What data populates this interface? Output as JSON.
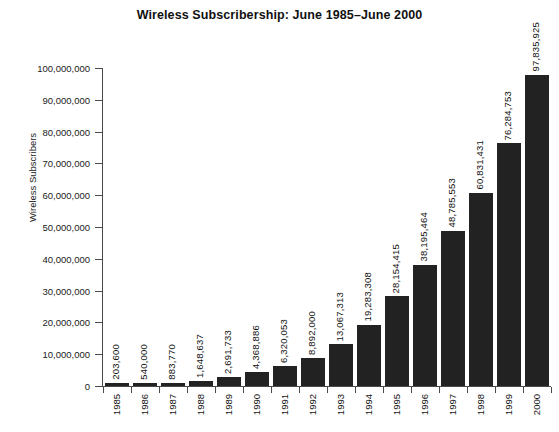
{
  "chart_data": {
    "type": "bar",
    "title": "Wireless Subscribership: June 1985–June 2000",
    "xlabel": "",
    "ylabel": "Wireless Subscribers",
    "ylim": [
      0,
      100000000
    ],
    "grid": false,
    "legend": null,
    "categories": [
      "1985",
      "1986",
      "1987",
      "1988",
      "1989",
      "1990",
      "1991",
      "1992",
      "1993",
      "1994",
      "1995",
      "1996",
      "1997",
      "1998",
      "1999",
      "2000"
    ],
    "values": [
      203600,
      540000,
      883770,
      1648637,
      2691733,
      4368886,
      6320053,
      8892000,
      13067313,
      19283308,
      28154415,
      38195464,
      48785553,
      60831431,
      76284753,
      97835925
    ],
    "value_labels": [
      "203,600",
      "540,000",
      "883,770",
      "1,648,637",
      "2,691,733",
      "4,368,886",
      "6,320,053",
      "8,892,000",
      "13,067,313",
      "19,283,308",
      "28,154,415",
      "38,195,464",
      "48,785,553",
      "60,831,431",
      "76,284,753",
      "97,835,925"
    ],
    "ytick_values": [
      0,
      10000000,
      20000000,
      30000000,
      40000000,
      50000000,
      60000000,
      70000000,
      80000000,
      90000000,
      100000000
    ],
    "ytick_labels": [
      "0",
      "10,000,000",
      "20,000,000",
      "30,000,000",
      "40,000,000",
      "50,000,000",
      "60,000,000",
      "70,000,000",
      "80,000,000",
      "90,000,000",
      "100,000,000"
    ],
    "bar_color": "#222222",
    "axis_color": "#4a4a4a",
    "background_color": "#ffffff"
  }
}
